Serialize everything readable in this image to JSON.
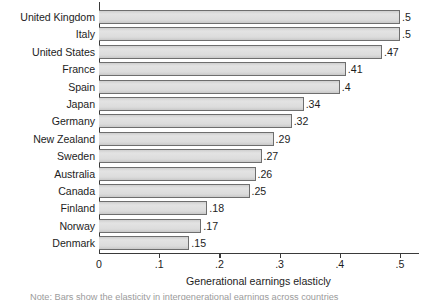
{
  "chart_data": {
    "type": "bar",
    "orientation": "horizontal",
    "title": "",
    "subtitle": "",
    "xlabel": "Generational earnings elasticly",
    "ylabel": "",
    "xlim": [
      0,
      0.5
    ],
    "grid": false,
    "legend": null,
    "categories": [
      "United Kingdom",
      "Italy",
      "United States",
      "France",
      "Spain",
      "Japan",
      "Germany",
      "New Zealand",
      "Sweden",
      "Australia",
      "Canada",
      "Finland",
      "Norway",
      "Denmark"
    ],
    "values": [
      0.5,
      0.5,
      0.47,
      0.41,
      0.4,
      0.34,
      0.32,
      0.29,
      0.27,
      0.26,
      0.25,
      0.18,
      0.17,
      0.15
    ],
    "data_labels": [
      ".5",
      ".5",
      ".47",
      ".41",
      ".4",
      ".34",
      ".32",
      ".29",
      ".27",
      ".26",
      ".25",
      ".18",
      ".17",
      ".15"
    ],
    "xticks": [
      0,
      0.1,
      0.2,
      0.3,
      0.4,
      0.5
    ],
    "xtick_labels": [
      "0",
      ".1",
      ".2",
      ".3",
      ".4",
      ".5"
    ],
    "colors": {
      "bar_fill": "#d9d9d9",
      "bar_border": "#6e6e6e",
      "axis": "#3a3a3a",
      "text": "#1d1d1d",
      "background": "#ffffff"
    }
  },
  "footnote": {
    "clipped_text": "Note: Bars show the elasticity in intergenerational earnings across countries"
  }
}
